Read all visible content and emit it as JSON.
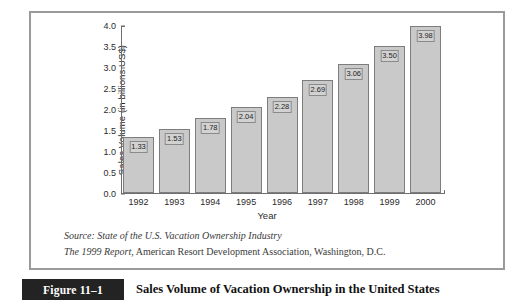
{
  "figure": {
    "tag": "Figure 11–1",
    "caption": "Sales Volume of Vacation Ownership in the United States"
  },
  "source": {
    "line1_prefix": "Source:",
    "line1_italic": "State of the U.S. Vacation Ownership Industry",
    "line2_italic": "The 1999 Report",
    "line2_rest": ", American Resort Development Association, Washington, D.C."
  },
  "colors": {
    "bar_fill": "#c9c9c9",
    "bar_stroke": "#7d7d7d",
    "label_fill": "#d2d2d2",
    "axis": "#6f6f6f",
    "panel_border": "#9a9a9a",
    "tag_background": "#232323",
    "tag_text": "#ffffff"
  },
  "chart_data": {
    "type": "bar",
    "title": "Sales Volume of Vacation Ownership in the United States",
    "xlabel": "Year",
    "ylabel": "Sales Volume (in billions US$)",
    "categories": [
      "1992",
      "1993",
      "1994",
      "1995",
      "1996",
      "1997",
      "1998",
      "1999",
      "2000"
    ],
    "values": [
      1.33,
      1.53,
      1.78,
      2.04,
      2.28,
      2.69,
      3.06,
      3.5,
      3.98
    ],
    "value_labels": [
      "1.33",
      "1.53",
      "1.78",
      "2.04",
      "2.28",
      "2.69",
      "3.06",
      "3.50",
      "3.98"
    ],
    "ylim": [
      0.0,
      4.0
    ],
    "yticks": [
      4.0,
      3.5,
      3.0,
      2.5,
      2.0,
      1.5,
      1.0,
      0.5,
      0.0
    ],
    "ytick_labels": [
      "4.0",
      "3.5",
      "3.0",
      "2.5",
      "2.0",
      "1.5",
      "1.0",
      "0.5",
      "0.0"
    ],
    "grid": false,
    "legend": null
  }
}
